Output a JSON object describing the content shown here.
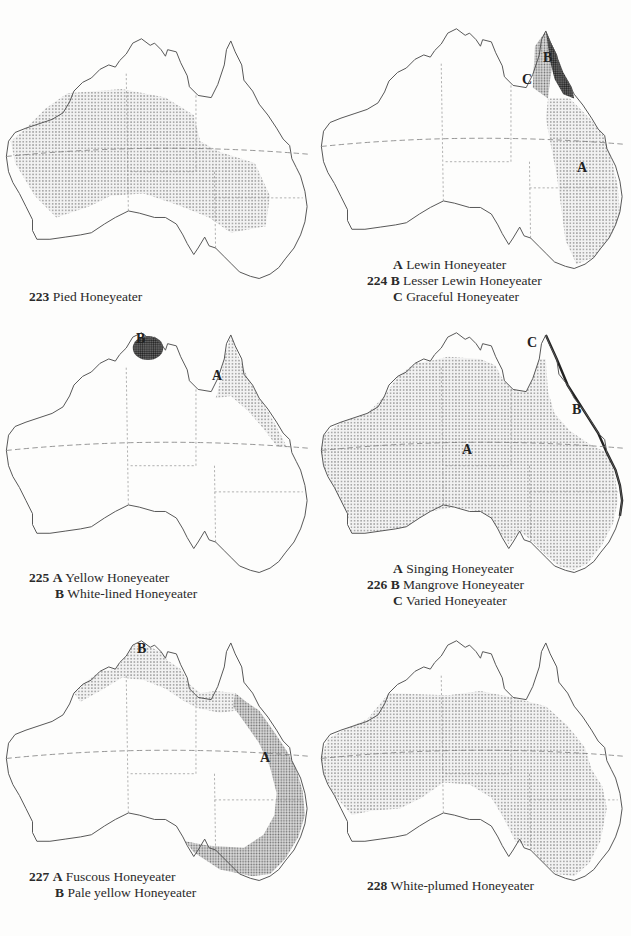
{
  "colors": {
    "background": "#fdfdfc",
    "coastline": "#555555",
    "borders": "#888888",
    "stipple_light": "#c8c8c8",
    "stipple_dark": "#7a7a7a",
    "text": "#2a2a2a"
  },
  "maps": [
    {
      "number": "223",
      "caption_lines": [
        {
          "letter": "",
          "name": "Pied Honeyeater"
        }
      ],
      "map_labels": []
    },
    {
      "number": "224",
      "caption_lines": [
        {
          "letter": "A",
          "name": "Lewin Honeyeater"
        },
        {
          "letter": "B",
          "name": "Lesser Lewin Honeyeater"
        },
        {
          "letter": "C",
          "name": "Graceful Honeyeater"
        }
      ],
      "map_labels": [
        "A",
        "B",
        "C"
      ]
    },
    {
      "number": "225",
      "caption_lines": [
        {
          "letter": "A",
          "name": "Yellow Honeyeater"
        },
        {
          "letter": "B",
          "name": "White-lined Honeyeater"
        }
      ],
      "map_labels": [
        "A",
        "B"
      ]
    },
    {
      "number": "226",
      "caption_lines": [
        {
          "letter": "A",
          "name": "Singing Honeyeater"
        },
        {
          "letter": "B",
          "name": "Mangrove Honeyeater"
        },
        {
          "letter": "C",
          "name": "Varied Honeyeater"
        }
      ],
      "map_labels": [
        "A",
        "B",
        "C"
      ]
    },
    {
      "number": "227",
      "caption_lines": [
        {
          "letter": "A",
          "name": "Fuscous Honeyeater"
        },
        {
          "letter": "B",
          "name": "Pale yellow Honeyeater"
        }
      ],
      "map_labels": [
        "A",
        "B"
      ]
    },
    {
      "number": "228",
      "caption_lines": [
        {
          "letter": "",
          "name": "White-plumed Honeyeater"
        }
      ],
      "map_labels": []
    }
  ]
}
